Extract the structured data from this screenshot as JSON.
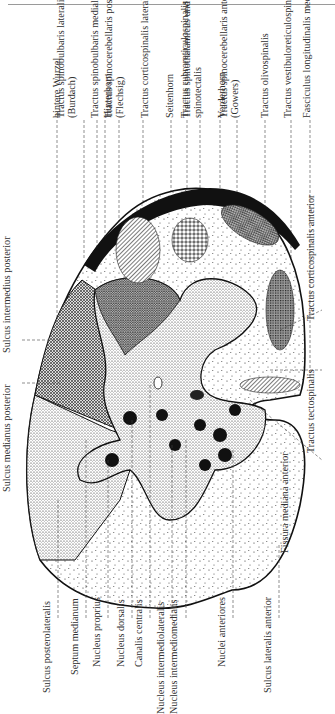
{
  "figure": {
    "orientation": "rotated-90-ccw",
    "colors": {
      "ink": "#1a1a1a",
      "text": "#303030",
      "paper": "#ffffff",
      "rule": "#9a9a9a"
    }
  },
  "labels_top": [
    {
      "id": "hintere-wurzel",
      "text": "hintere Wurzel"
    },
    {
      "id": "tractus-spinobulbaris-lateralis",
      "text": "Tractus spinobulbaris lateralis",
      "text2": "(Burdach)"
    },
    {
      "id": "tractus-spinobulbaris-medialis",
      "text": "Tractus spinobulbaris medialis (Goll)"
    },
    {
      "id": "hinterhorn",
      "text": "Hinterhorn"
    },
    {
      "id": "tractus-spinocerebellaris-posterior",
      "text": "Tractus spinocerebellaris posterior",
      "text2": "(Flechsig)"
    },
    {
      "id": "tractus-corticospinalis-lateralis",
      "text": "Tractus corticospinalis lateralis"
    },
    {
      "id": "seitenhorn",
      "text": "Seitenhorn"
    },
    {
      "id": "tractus-rubroreticulospinalis",
      "text": "Tractus rubroreticulospinalis"
    },
    {
      "id": "tractus-spinothalamicus",
      "text": "Tractus spinothalamicus und",
      "text2": "spinotectalis"
    },
    {
      "id": "vorderhorn",
      "text": "Vorderhorn"
    },
    {
      "id": "tractus-spinocerebellaris-anterior",
      "text": "Tractus spinocerebellaris anterior",
      "text2": "(Gowers)"
    },
    {
      "id": "tractus-olivospinalis",
      "text": "Tractus olivospinalis"
    },
    {
      "id": "tractus-vestibuloreticulospinalis",
      "text": "Tractus vestibuloreticulospinalis"
    },
    {
      "id": "fasciculus-longitudinalis-medialis",
      "text": "Fasciculus longitudinalis medialis"
    }
  ],
  "labels_left": [
    {
      "id": "sulcus-intermedius-posterior",
      "text": "Sulcus intermedius posterior"
    },
    {
      "id": "sulcus-medianus-posterior",
      "text": "Sulcus medianus posterior"
    }
  ],
  "labels_bottom": [
    {
      "id": "sulcus-posterolateralis",
      "text": "Sulcus posterolateralis"
    },
    {
      "id": "septum-medianum",
      "text": "Septum medianum"
    },
    {
      "id": "nucleus-proprius",
      "text": "Nucleus proprius"
    },
    {
      "id": "nucleus-dorsalis",
      "text": "Nucleus dorsalis"
    },
    {
      "id": "canalis-centralis",
      "text": "Canalis centralis"
    },
    {
      "id": "nucleus-intermediolateralis",
      "text": "Nucleus intermediolateralis"
    },
    {
      "id": "nucleus-intermediomedialis",
      "text": "Nucleus intermediomedialis"
    },
    {
      "id": "nuclei-anteriores",
      "text": "Nuclei anteriores"
    },
    {
      "id": "sulcus-lateralis-anterior",
      "text": "Sulcus lateralis anterior"
    }
  ],
  "labels_right": [
    {
      "id": "fissura-mediana-anterior",
      "text": "Fissura mediana anterior"
    },
    {
      "id": "tractus-tectospinalis",
      "text": "Tractus tectospinalis"
    },
    {
      "id": "tractus-corticospinalis-anterior",
      "text": "Tractus corticospinalis anterior"
    }
  ]
}
